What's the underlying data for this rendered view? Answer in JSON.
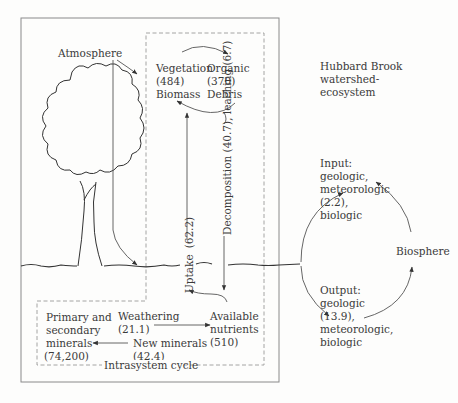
{
  "title_lines": [
    "Hubbard Brook",
    "watershed-",
    "ecosystem"
  ],
  "atmosphere": "Atmosphere",
  "vegetation": {
    "lines": [
      "Vegetation",
      "(484)",
      "Biomass"
    ],
    "value": 484
  },
  "organic_debris": {
    "lines": [
      "Organic",
      "(370)",
      "Debris"
    ],
    "value": 370
  },
  "uptake": {
    "label": "Uptake",
    "value_label": "(62.2)",
    "value": 62.2
  },
  "decomposition_leaching": {
    "label": "Decomposition (40.7), leaching (6.7)",
    "decomposition": 40.7,
    "leaching": 6.7
  },
  "primary_minerals": {
    "lines": [
      "Primary and",
      "secondary",
      "minerals",
      "(74,200)"
    ],
    "value": 74200
  },
  "weathering": {
    "lines": [
      "Weathering",
      "(21.1)"
    ],
    "value": 21.1
  },
  "new_minerals": {
    "lines": [
      "New minerals",
      "(42.4)"
    ],
    "value": 42.4
  },
  "available_nutrients": {
    "lines": [
      "Available",
      "nutrients",
      "(510)"
    ],
    "value": 510
  },
  "intrasystem_cycle": "Intrasystem cycle",
  "input": {
    "lines": [
      "Input:",
      "geologic,",
      "meteorologic",
      "(2.2),",
      "biologic"
    ],
    "value": 2.2
  },
  "output": {
    "lines": [
      "Output:",
      "geologic",
      "(13.9),",
      "meteorologic,",
      "biologic"
    ],
    "value": 13.9
  },
  "biosphere": "Biosphere",
  "colors": {
    "line": "#555555",
    "dashed": "#9a9a9a",
    "text": "#3a3a3a",
    "background": "#fdfdfc"
  }
}
